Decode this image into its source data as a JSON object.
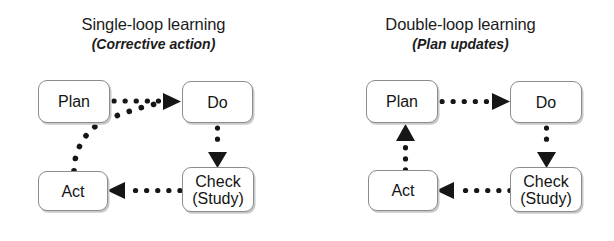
{
  "figure": {
    "type": "diagram",
    "subtype": "pdca-learning-loops",
    "background": "#ffffff",
    "ink": "#161616",
    "box_border": "#8c8c8c",
    "box_fill": "#ffffff",
    "box_shadow": "#c9c9c9"
  },
  "panels": [
    {
      "id": "single-loop",
      "title": "Single-loop learning",
      "subtitle": "(Corrective action)",
      "nodes": [
        {
          "id": "plan",
          "label": "Plan",
          "label2": ""
        },
        {
          "id": "do",
          "label": "Do",
          "label2": ""
        },
        {
          "id": "act",
          "label": "Act",
          "label2": ""
        },
        {
          "id": "check",
          "label": "Check",
          "label2": "(Study)"
        }
      ],
      "arrows": [
        {
          "id": "plan-to-do",
          "from": "Plan",
          "to": "Do",
          "style": "dotted",
          "shape": "straight-horizontal",
          "direction": "right"
        },
        {
          "id": "do-to-check",
          "from": "Do",
          "to": "Check",
          "style": "dotted",
          "shape": "straight-vertical",
          "direction": "down"
        },
        {
          "id": "check-to-act",
          "from": "Check",
          "to": "Act",
          "style": "dotted",
          "shape": "straight-horizontal",
          "direction": "left"
        },
        {
          "id": "act-to-do-curve",
          "from": "Act",
          "to": "Do",
          "style": "dotted",
          "shape": "curved-diagonal",
          "direction": "up-right"
        }
      ]
    },
    {
      "id": "double-loop",
      "title": "Double-loop learning",
      "subtitle": "(Plan updates)",
      "nodes": [
        {
          "id": "plan",
          "label": "Plan",
          "label2": ""
        },
        {
          "id": "do",
          "label": "Do",
          "label2": ""
        },
        {
          "id": "act",
          "label": "Act",
          "label2": ""
        },
        {
          "id": "check",
          "label": "Check",
          "label2": "(Study)"
        }
      ],
      "arrows": [
        {
          "id": "plan-to-do",
          "from": "Plan",
          "to": "Do",
          "style": "dotted",
          "shape": "straight-horizontal",
          "direction": "right"
        },
        {
          "id": "do-to-check",
          "from": "Do",
          "to": "Check",
          "style": "dotted",
          "shape": "straight-vertical",
          "direction": "down"
        },
        {
          "id": "check-to-act",
          "from": "Check",
          "to": "Act",
          "style": "dotted",
          "shape": "straight-horizontal",
          "direction": "left"
        },
        {
          "id": "act-to-plan",
          "from": "Act",
          "to": "Plan",
          "style": "dotted",
          "shape": "straight-vertical",
          "direction": "up"
        }
      ]
    }
  ]
}
